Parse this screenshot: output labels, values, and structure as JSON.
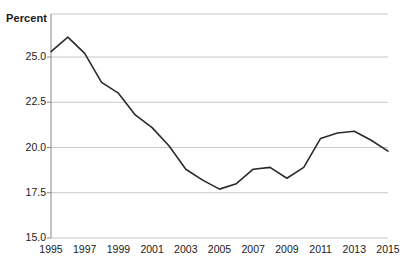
{
  "chart_data": {
    "type": "line",
    "title": "",
    "subtitle": "",
    "xlabel": "",
    "ylabel": "Percent",
    "ylim": [
      15.0,
      26.8
    ],
    "xlim": [
      1995,
      2015
    ],
    "grid": true,
    "legend": null,
    "yticks": [
      "15.0",
      "17.5",
      "20.0",
      "22.5",
      "25.0"
    ],
    "ytick_values": [
      15.0,
      17.5,
      20.0,
      22.5,
      25.0
    ],
    "xticks": [
      "1995",
      "1997",
      "1999",
      "2001",
      "2003",
      "2005",
      "2007",
      "2009",
      "2011",
      "2013",
      "2015"
    ],
    "xtick_values": [
      1995,
      1997,
      1999,
      2001,
      2003,
      2005,
      2007,
      2009,
      2011,
      2013,
      2015
    ],
    "x": [
      1995,
      1996,
      1997,
      1998,
      1999,
      2000,
      2001,
      2002,
      2003,
      2004,
      2005,
      2006,
      2007,
      2008,
      2009,
      2010,
      2011,
      2012,
      2013,
      2014,
      2015
    ],
    "values": [
      25.3,
      26.1,
      25.2,
      23.6,
      23.0,
      21.8,
      21.1,
      20.1,
      18.8,
      18.2,
      17.7,
      18.0,
      18.8,
      18.9,
      18.3,
      18.9,
      20.5,
      20.8,
      20.9,
      20.4,
      19.8
    ],
    "series": [
      {
        "name": "Percent",
        "color": "#2b2b2b",
        "values": [
          25.3,
          26.1,
          25.2,
          23.6,
          23.0,
          21.8,
          21.1,
          20.1,
          18.8,
          18.2,
          17.7,
          18.0,
          18.8,
          18.9,
          18.3,
          18.9,
          20.5,
          20.8,
          20.9,
          20.4,
          19.8
        ]
      }
    ],
    "colors": {
      "line": "#2b2b2b",
      "grid": "#c8c8c8",
      "axis": "#8a8a8a",
      "text": "#1a1a1a",
      "background": "#ffffff"
    }
  }
}
